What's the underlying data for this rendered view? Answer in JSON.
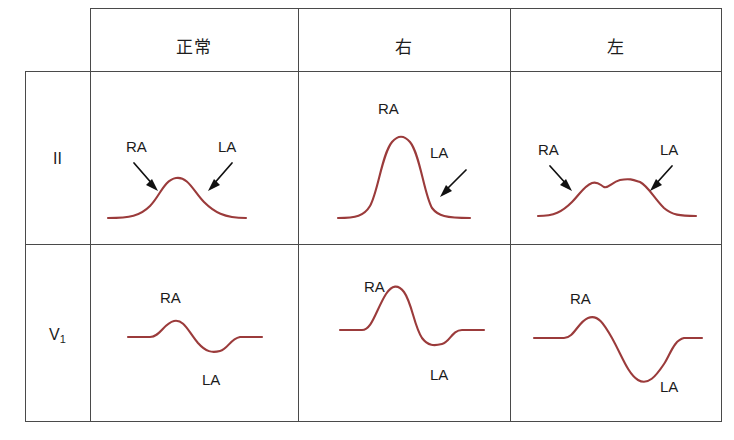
{
  "figure": {
    "kind": "ecg-p-wave-morphology-table",
    "colors": {
      "wave": "#9b3b3b",
      "grid": "#4a4a4a",
      "text": "#1b1b1b",
      "background": "#ffffff"
    }
  },
  "table": {
    "corner_label": "",
    "column_headers": [
      {
        "id": "normal",
        "label": "正常"
      },
      {
        "id": "right",
        "label": "右"
      },
      {
        "id": "left",
        "label": "左"
      }
    ],
    "row_headers": [
      {
        "id": "lead-2",
        "label": "II",
        "sub": ""
      },
      {
        "id": "lead-v1",
        "label": "V",
        "sub": "1"
      }
    ],
    "cells": [
      {
        "row": "lead-2",
        "column": "normal",
        "annotations": [
          {
            "text": "RA",
            "arrow": true
          },
          {
            "text": "LA",
            "arrow": true
          }
        ]
      },
      {
        "row": "lead-2",
        "column": "right",
        "annotations": [
          {
            "text": "RA",
            "arrow": false
          },
          {
            "text": "LA",
            "arrow": true
          }
        ]
      },
      {
        "row": "lead-2",
        "column": "left",
        "annotations": [
          {
            "text": "RA",
            "arrow": true
          },
          {
            "text": "LA",
            "arrow": true
          }
        ]
      },
      {
        "row": "lead-v1",
        "column": "normal",
        "annotations": [
          {
            "text": "RA",
            "arrow": false
          },
          {
            "text": "LA",
            "arrow": false
          }
        ]
      },
      {
        "row": "lead-v1",
        "column": "right",
        "annotations": [
          {
            "text": "RA",
            "arrow": false
          },
          {
            "text": "LA",
            "arrow": false
          }
        ]
      },
      {
        "row": "lead-v1",
        "column": "left",
        "annotations": [
          {
            "text": "RA",
            "arrow": false
          },
          {
            "text": "LA",
            "arrow": false
          }
        ]
      }
    ]
  },
  "labels": {
    "ra": "RA",
    "la": "LA",
    "header_normal": "正常",
    "header_right": "右",
    "header_left": "左",
    "row_two": "II",
    "row_v": "V",
    "row_v_sub": "1"
  }
}
